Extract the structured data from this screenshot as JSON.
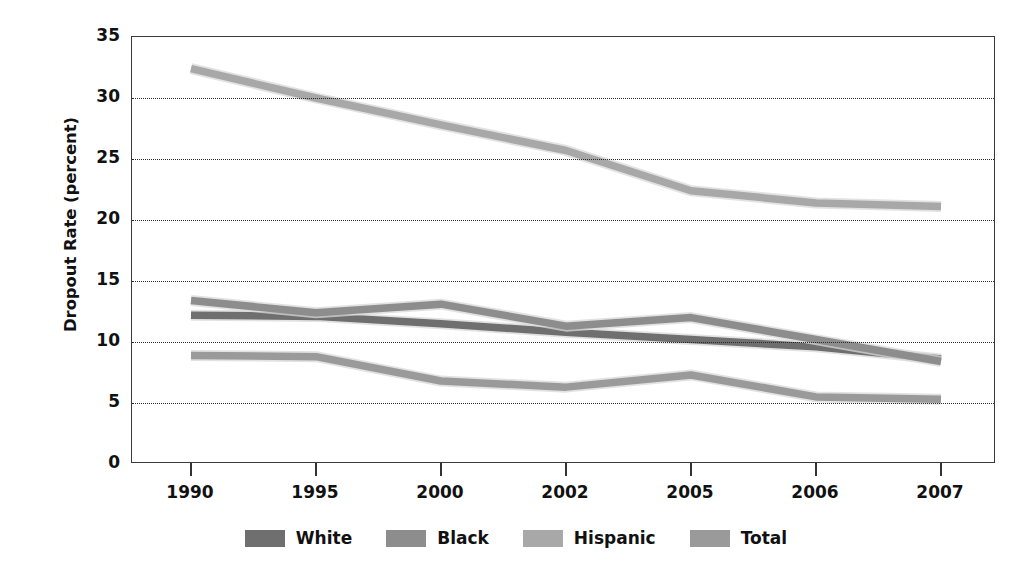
{
  "figure": {
    "top_caption": "",
    "background": "#ffffff"
  },
  "axes": {
    "y_title": "Dropout Rate (percent)",
    "y_ticks": [
      "35",
      "30",
      "25",
      "20",
      "15",
      "10",
      "5",
      "0"
    ],
    "x_ticks": [
      "1990",
      "1995",
      "2000",
      "2002",
      "2005",
      "2006",
      "2007"
    ]
  },
  "legend": {
    "position": "bottom-center",
    "items": [
      {
        "label": "White",
        "color": "#6f6f6f"
      },
      {
        "label": "Black",
        "color": "#8d8d8d"
      },
      {
        "label": "Hispanic",
        "color": "#a8a8a8"
      },
      {
        "label": "Total",
        "color": "#9a9a9a"
      }
    ]
  },
  "chart_data": {
    "type": "line",
    "title": "",
    "xlabel": "",
    "ylabel": "Dropout Rate (percent)",
    "categories": [
      "1990",
      "1995",
      "2000",
      "2002",
      "2005",
      "2006",
      "2007"
    ],
    "ylim": [
      0,
      35
    ],
    "ytick_step": 5,
    "grid": true,
    "grid_style": "dotted-horizontal",
    "legend_position": "bottom-center",
    "series": [
      {
        "name": "White",
        "color": "#6f6f6f",
        "values": [
          12.2,
          12.1,
          11.5,
          10.8,
          10.2,
          9.6,
          8.6
        ]
      },
      {
        "name": "Black",
        "color": "#8d8d8d",
        "values": [
          13.4,
          12.4,
          13.1,
          11.3,
          12.0,
          10.2,
          8.4
        ]
      },
      {
        "name": "Hispanic",
        "color": "#a8a8a8",
        "values": [
          32.4,
          30.0,
          27.8,
          25.7,
          22.4,
          21.4,
          21.1
        ]
      },
      {
        "name": "Total",
        "color": "#9a9a9a",
        "values": [
          8.9,
          8.8,
          6.8,
          6.3,
          7.3,
          5.5,
          5.3
        ]
      }
    ]
  }
}
